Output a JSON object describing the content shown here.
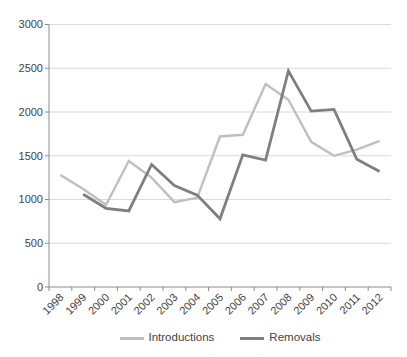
{
  "chart_data": {
    "type": "line",
    "categories": [
      "1998",
      "1999",
      "2000",
      "2001",
      "2002",
      "2003",
      "2004",
      "2005",
      "2006",
      "2007",
      "2008",
      "2009",
      "2010",
      "2011",
      "2012"
    ],
    "series": [
      {
        "name": "Introductions",
        "color": "#bfbfbf",
        "values": [
          1280,
          1120,
          940,
          1440,
          1250,
          970,
          1020,
          1720,
          1740,
          2320,
          2140,
          1660,
          1500,
          1570,
          1670
        ]
      },
      {
        "name": "Removals",
        "color": "#7f7f7f",
        "values": [
          null,
          1060,
          900,
          870,
          1400,
          1160,
          1050,
          780,
          1510,
          1450,
          2470,
          2010,
          2030,
          1460,
          1320
        ]
      }
    ],
    "y_ticks": [
      0,
      500,
      1000,
      1500,
      2000,
      2500,
      3000
    ],
    "ylim": [
      0,
      3000
    ],
    "grid": true,
    "legend_position": "bottom",
    "gridline_color": "#d9d9d9",
    "axis_color": "#8c8c8c",
    "text_color": "#3f3f3f"
  }
}
